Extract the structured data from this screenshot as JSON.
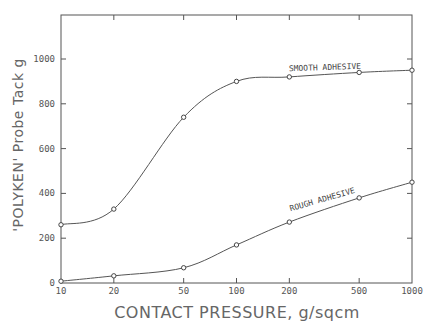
{
  "chart_data": {
    "type": "line",
    "title": "",
    "xlabel": "CONTACT PRESSURE, g/sqcm",
    "ylabel": "'POLYKEN' Probe Tack g",
    "xscale": "log",
    "x": [
      10,
      20,
      50,
      100,
      200,
      500,
      1000
    ],
    "xticks": [
      10,
      20,
      50,
      100,
      200,
      500,
      1000
    ],
    "xtick_labels": [
      "10",
      "20",
      "50",
      "100",
      "200",
      "500",
      "1000"
    ],
    "yticks": [
      0,
      200,
      400,
      600,
      800,
      1000
    ],
    "ytick_labels": [
      "0",
      "200",
      "400",
      "600",
      "800",
      "1000"
    ],
    "xlim": [
      10,
      1000
    ],
    "ylim": [
      0,
      1200
    ],
    "grid": false,
    "legend": "inline labels on curves",
    "series": [
      {
        "name": "SMOOTH ADHESIVE",
        "values": [
          260,
          330,
          740,
          900,
          920,
          940,
          950
        ]
      },
      {
        "name": "ROUGH ADHESIVE",
        "values": [
          8,
          32,
          68,
          170,
          272,
          380,
          450
        ]
      }
    ]
  }
}
